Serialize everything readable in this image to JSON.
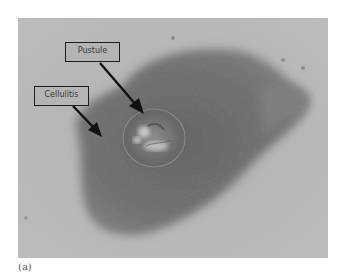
{
  "figure": {
    "annotations": [
      {
        "label": "Pustule"
      },
      {
        "label": "Cellulitis"
      }
    ],
    "caption": "(a)"
  },
  "colors": {
    "background": "#ffffff",
    "skin": "#b8b8b8",
    "lesion": "#6e6e6e",
    "label_border": "#1e1e1e",
    "arrow": "#111111"
  }
}
